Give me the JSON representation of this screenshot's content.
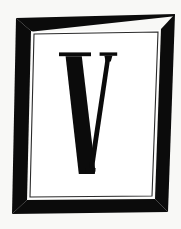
{
  "artwork": {
    "title": "V Monogram",
    "kind": "logo-mark",
    "letter": "V",
    "letter_style": "didone-serif-capital",
    "description": "Capital letter V inside a skewed hand-drawn rectangular frame",
    "canvas": {
      "width": 181,
      "height": 229
    },
    "colors": {
      "background": "#f8f8f6",
      "ink": "#0b0b0b",
      "panel": "#ffffff",
      "hairline": "#2a2a2a"
    },
    "frame": {
      "name": "skewed-rectangle-frame",
      "outer_corners": [
        [
          16,
          18
        ],
        [
          175,
          14
        ],
        [
          168,
          212
        ],
        [
          12,
          214
        ]
      ],
      "inner_corners": [
        [
          31,
          31
        ],
        [
          161,
          29
        ],
        [
          155,
          199
        ],
        [
          27,
          200
        ]
      ],
      "panel_corners": [
        [
          34,
          34
        ],
        [
          158,
          32
        ],
        [
          152,
          196
        ],
        [
          30,
          197
        ]
      ]
    },
    "glyph": {
      "name": "letter-v",
      "character": "V",
      "bounds": {
        "x": 59,
        "y": 52,
        "width": 58,
        "height": 122
      }
    }
  }
}
